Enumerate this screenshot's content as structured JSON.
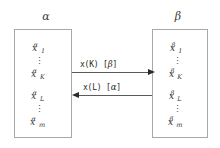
{
  "diagram": {
    "groups": [
      {
        "id": "alpha",
        "label": "α",
        "entries": [
          {
            "base": "x",
            "sub": "1",
            "sup": "α"
          },
          {
            "dots": "⋮"
          },
          {
            "base": "x",
            "sub": "K",
            "sup": "α"
          },
          {
            "base": "x",
            "sub": "L",
            "sup": "α"
          },
          {
            "dots": "⋮"
          },
          {
            "base": "x",
            "sub": "m",
            "sup": "α"
          }
        ]
      },
      {
        "id": "beta",
        "label": "β",
        "entries": [
          {
            "base": "x",
            "sub": "1",
            "sup": "β"
          },
          {
            "dots": "⋮"
          },
          {
            "base": "x",
            "sub": "K",
            "sup": "β"
          },
          {
            "base": "x",
            "sub": "L",
            "sup": "β"
          },
          {
            "dots": "⋮"
          },
          {
            "base": "x",
            "sub": "m",
            "sup": "β"
          }
        ]
      }
    ],
    "arrows": [
      {
        "id": "alpha-to-beta",
        "direction": "right",
        "label_prefix": "x(K) [",
        "label_greek": "β",
        "label_suffix": "]",
        "label_full": "x(K) [β]"
      },
      {
        "id": "beta-to-alpha",
        "direction": "left",
        "label_prefix": "x(L) [",
        "label_greek": "α",
        "label_suffix": "]",
        "label_full": "x(L) [α]"
      }
    ],
    "colors": {
      "box_border": "#a8a8a8",
      "arrow": "#2a2a2a",
      "text": "#3a3a3a",
      "background": "#ffffff"
    }
  }
}
